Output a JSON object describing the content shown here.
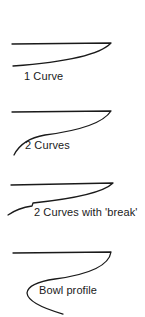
{
  "diagram": {
    "type": "profile-sketches",
    "stroke_color": "#1a1a1a",
    "background": "#ffffff",
    "profiles": [
      {
        "id": "one-curve",
        "label": "1 Curve",
        "path": "M12,44 L111,43 Q95,60 13,66"
      },
      {
        "id": "two-curves",
        "label": "2 Curves",
        "path": "M12,112 L111,111 Q100,128 45,135 Q22,139 14,155"
      },
      {
        "id": "two-curves-break",
        "label": "2 Curves with 'break'",
        "path": "M11,185 L113,183 Q100,196 33,203 L32,206 Q18,208 8,215"
      },
      {
        "id": "bowl-profile",
        "label": "Bowl profile",
        "path": "M13,253 L111,252 Q108,272 55,279 Q28,283 27,293 Q28,304 63,314"
      }
    ]
  }
}
